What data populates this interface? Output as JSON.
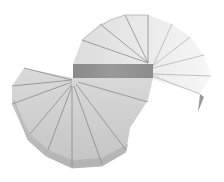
{
  "scene": {
    "subject": "3D spiral ramp / helical staircase surface",
    "background": "#ffffff",
    "colors": {
      "upper_surface": "#e6e6e6",
      "upper_surface_fade": "#f4f4f4",
      "lower_surface": "#cfcfcf",
      "side_wall": "#bdbdbd",
      "dark_band": "#8f8f8f",
      "edge_lines": "#8a8a8a"
    }
  }
}
